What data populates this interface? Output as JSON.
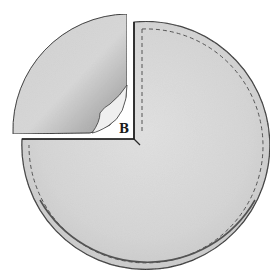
{
  "figure": {
    "label_b": "B",
    "colors": {
      "background": "#ffffff",
      "fabric": "#dcdcdc",
      "fabric_dark": "#b8b8b8",
      "outline": "#2a2a2a",
      "stitch": "#555555"
    }
  }
}
